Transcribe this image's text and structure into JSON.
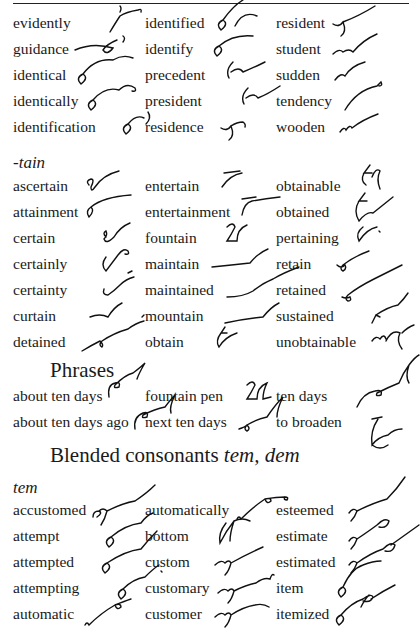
{
  "page": {
    "block1": {
      "rows": [
        [
          "evidently",
          "identified",
          "resident"
        ],
        [
          "guidance",
          "identify",
          "student"
        ],
        [
          "identical",
          "precedent",
          "sudden"
        ],
        [
          "identically",
          "president",
          "tendency"
        ],
        [
          "identification",
          "residence",
          "wooden"
        ]
      ]
    },
    "tain_section": {
      "label": "-tain",
      "rows": [
        [
          "ascertain",
          "entertain",
          "obtainable"
        ],
        [
          "attainment",
          "entertainment",
          "obtained"
        ],
        [
          "certain",
          "fountain",
          "pertaining"
        ],
        [
          "certainly",
          "maintain",
          "retain"
        ],
        [
          "certainty",
          "maintained",
          "retained"
        ],
        [
          "curtain",
          "mountain",
          "sustained"
        ],
        [
          "detained",
          "obtain",
          "unobtainable"
        ]
      ]
    },
    "phrases_section": {
      "heading": "Phrases",
      "rows": [
        [
          "about ten days",
          "fountain pen",
          "ten days"
        ],
        [
          "about ten days ago",
          "next ten days",
          "to broaden"
        ]
      ]
    },
    "blended_section": {
      "heading_main": "Blended consonants ",
      "heading_italic": "tem, dem",
      "label": "tem",
      "rows": [
        [
          "accustomed",
          "automatically",
          "esteemed"
        ],
        [
          "attempt",
          "bottom",
          "estimate"
        ],
        [
          "attempted",
          "custom",
          "estimated"
        ],
        [
          "attempting",
          "customary",
          "item"
        ],
        [
          "automatic",
          "customer",
          "itemized"
        ]
      ]
    }
  }
}
